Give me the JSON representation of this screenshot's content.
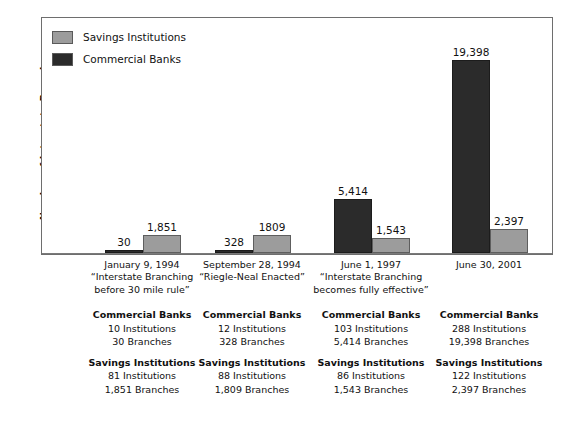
{
  "chart_data": {
    "type": "bar",
    "title": "",
    "xlabel": "",
    "ylabel": "Number of Interstate Branches",
    "ylim": [
      0,
      21500
    ],
    "grid": false,
    "legend_position": "top-left",
    "categories": [
      "January 9, 1994",
      "September 28, 1994",
      "June 1, 1997",
      "June 30, 2001"
    ],
    "series": [
      {
        "name": "Commercial Banks",
        "color": "#2b2b2b",
        "values": [
          30,
          328,
          5414,
          19398
        ],
        "labels": [
          "30",
          "328",
          "5,414",
          "19,398"
        ]
      },
      {
        "name": "Savings Institutions",
        "color": "#9c9c9c",
        "values": [
          1851,
          1809,
          1543,
          2397
        ],
        "labels": [
          "1,851",
          "1809",
          "1,543",
          "2,397"
        ]
      }
    ]
  },
  "legend": {
    "items": [
      {
        "label": "Savings Institutions",
        "color": "#9c9c9c"
      },
      {
        "label": "Commercial Banks",
        "color": "#2b2b2b"
      }
    ]
  },
  "axis": {
    "y_title": "Number of Interstate Branches"
  },
  "x_captions": [
    {
      "line1": "January 9, 1994",
      "line2": "“Interstate Branching",
      "line3": "before 30 mile rule”"
    },
    {
      "line1": "September 28, 1994",
      "line2": "“Riegle-Neal Enacted”",
      "line3": ""
    },
    {
      "line1": "June 1, 1997",
      "line2": "“Interstate Branching",
      "line3": "becomes fully effective”"
    },
    {
      "line1": "June 30, 2001",
      "line2": "",
      "line3": ""
    }
  ],
  "detail_columns": [
    {
      "commercial_heading": "Commercial Banks",
      "commercial_institutions": "10 Institutions",
      "commercial_branches": "30 Branches",
      "savings_heading": "Savings Institutions",
      "savings_institutions": "81 Institutions",
      "savings_branches": "1,851 Branches"
    },
    {
      "commercial_heading": "Commercial Banks",
      "commercial_institutions": "12 Institutions",
      "commercial_branches": "328 Branches",
      "savings_heading": "Savings Institutions",
      "savings_institutions": "88 Institutions",
      "savings_branches": "1,809 Branches"
    },
    {
      "commercial_heading": "Commercial Banks",
      "commercial_institutions": "103 Institutions",
      "commercial_branches": "5,414 Branches",
      "savings_heading": "Savings Institutions",
      "savings_institutions": "86 Institutions",
      "savings_branches": "1,543 Branches"
    },
    {
      "commercial_heading": "Commercial Banks",
      "commercial_institutions": "288 Institutions",
      "commercial_branches": "19,398 Branches",
      "savings_heading": "Savings Institutions",
      "savings_institutions": "122 Institutions",
      "savings_branches": "2,397 Branches"
    }
  ]
}
